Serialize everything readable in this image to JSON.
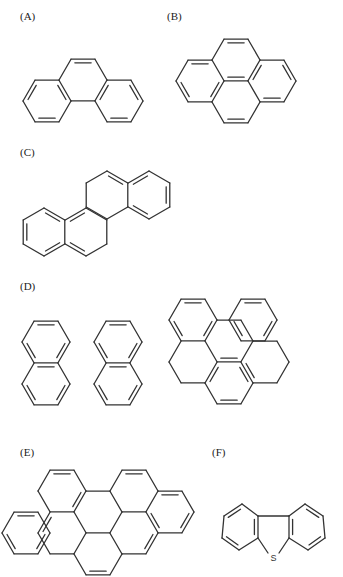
{
  "panels": [
    {
      "id": "A",
      "label": "(A)",
      "pos": [
        20,
        17
      ],
      "name": "phenanthrene",
      "orient": "flat",
      "rings": [
        [
          47,
          101
        ],
        [
          83,
          80
        ],
        [
          119,
          101
        ]
      ],
      "doubles": [
        [
          0,
          [
            1,
            3,
            5
          ]
        ],
        [
          1,
          [
            0
          ]
        ],
        [
          2,
          [
            1,
            3,
            5
          ]
        ]
      ]
    },
    {
      "id": "B",
      "label": "(B)",
      "pos": [
        167,
        17
      ],
      "name": "pyrene",
      "orient": "flat",
      "rings": [
        [
          236,
          60
        ],
        [
          200,
          81
        ],
        [
          272,
          81
        ],
        [
          236,
          102
        ]
      ],
      "doubles": [
        [
          0,
          [
            0
          ]
        ],
        [
          1,
          [
            0,
            2,
            4
          ]
        ],
        [
          2,
          [
            5,
            1,
            3
          ]
        ],
        [
          3,
          [
            3
          ]
        ],
        [
          0,
          [
            3
          ]
        ]
      ]
    },
    {
      "id": "C",
      "label": "(C)",
      "pos": [
        20,
        151
      ],
      "name": "chrysene",
      "orient": "pointy",
      "rings": [
        [
          44,
          232
        ],
        [
          86,
          232
        ],
        [
          107,
          195
        ],
        [
          149,
          195
        ]
      ],
      "doubles": [
        [
          0,
          [
            0,
            2,
            4
          ]
        ],
        [
          1,
          [
            3
          ]
        ],
        [
          2,
          [
            0
          ]
        ],
        [
          3,
          [
            1,
            3,
            5
          ]
        ],
        [
          1,
          [
            5
          ]
        ]
      ]
    },
    {
      "id": "D",
      "label": "(D)",
      "pos": [
        20,
        285
      ],
      "name": "perylene",
      "orient": "flat",
      "rings": [
        [
          46,
          342
        ],
        [
          46,
          384
        ],
        [
          118,
          342
        ],
        [
          118,
          384
        ]
      ],
      "doubles": [
        [
          0,
          [
            0,
            2,
            4
          ]
        ],
        [
          1,
          [
            4,
            0,
            2
          ]
        ],
        [
          2,
          [
            0,
            2,
            4
          ]
        ],
        [
          3,
          [
            4,
            0,
            2
          ]
        ]
      ]
    },
    {
      "id": "D2",
      "label": "",
      "pos": [
        0,
        0
      ],
      "name": "benzo[e]pyrene",
      "orient": "flat",
      "rings": [
        [
          193,
          320
        ],
        [
          253,
          320
        ],
        [
          229,
          341
        ],
        [
          229,
          383
        ],
        [
          193,
          362
        ],
        [
          265,
          362
        ]
      ],
      "doubles": [
        [
          0,
          [
            0,
            2,
            4
          ]
        ],
        [
          1,
          [
            0,
            2,
            4
          ]
        ],
        [
          2,
          [
            3
          ]
        ],
        [
          3,
          [
            3,
            5,
            1
          ]
        ],
        [
          5,
          [
            4
          ]
        ]
      ]
    },
    {
      "id": "E",
      "label": "(E)",
      "pos": [
        20,
        443
      ],
      "name": "benzo[ghi]perylene-like / anthanthrene",
      "orient": "flat",
      "rings": [
        [
          62,
          491
        ],
        [
          98,
          512
        ],
        [
          134,
          491
        ],
        [
          170,
          512
        ],
        [
          26,
          533
        ],
        [
          62,
          533
        ],
        [
          98,
          554
        ],
        [
          134,
          533
        ]
      ],
      "doubles": [
        [
          0,
          [
            0,
            2
          ]
        ],
        [
          2,
          [
            0
          ]
        ],
        [
          3,
          [
            0,
            2,
            4
          ]
        ],
        [
          4,
          [
            0,
            2,
            4
          ]
        ],
        [
          5,
          [
            5
          ]
        ],
        [
          6,
          [
            3
          ]
        ],
        [
          7,
          [
            2
          ]
        ]
      ]
    },
    {
      "id": "F",
      "label": "(F)",
      "pos": [
        217,
        443
      ],
      "name": "dibenzothiophene",
      "heteroatom": "S"
    }
  ]
}
